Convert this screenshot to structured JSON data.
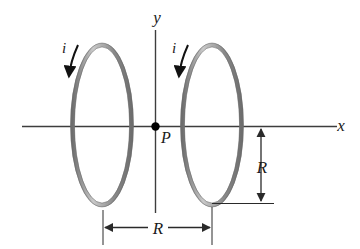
{
  "figure": {
    "background_color": "#ffffff",
    "width": 360,
    "height": 249
  },
  "axes": {
    "x_label": "x",
    "y_label": "y",
    "axis_color": "#3d3d3d",
    "x_axis": {
      "y": 126,
      "x_start": 22,
      "x_end": 337
    },
    "y_axis": {
      "x": 155,
      "y_start": 30,
      "y_end": 213
    }
  },
  "point": {
    "label": "P",
    "x": 155,
    "y": 126,
    "dot_color": "#000000"
  },
  "loops": [
    {
      "name": "left-loop",
      "current_label": "i",
      "cx": 102,
      "cy": 125,
      "rx": 30,
      "ry": 80,
      "stroke_color": "#7d7d7d"
    },
    {
      "name": "right-loop",
      "current_label": "i",
      "cx": 212,
      "cy": 125,
      "rx": 30,
      "ry": 80,
      "stroke_color": "#7d7d7d"
    }
  ],
  "dimensions": [
    {
      "name": "loop-radius",
      "label": "R",
      "orientation": "vertical",
      "x": 261,
      "y_start": 127,
      "y_end": 203
    },
    {
      "name": "loop-separation",
      "label": "R",
      "orientation": "horizontal",
      "y": 227,
      "x_start": 103,
      "x_end": 212
    }
  ],
  "colors": {
    "loop_gray": "#7d7d7d",
    "loop_gray_light": "#b5b5b5",
    "axis_dark": "#3d3d3d",
    "text_dark": "#1a1a1a",
    "dimension_line": "#2a2a2a"
  }
}
